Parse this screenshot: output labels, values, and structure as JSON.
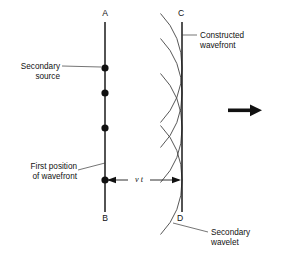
{
  "figure": {
    "background_color": "#ffffff",
    "ink_color": "#111111",
    "arc_color": "#3a3a3a"
  },
  "point_labels": {
    "a": "A",
    "b": "B",
    "c": "C",
    "d": "D"
  },
  "callouts": {
    "secondary_source_line1": "Secondary",
    "secondary_source_line2": "source",
    "first_position_line1": "First position",
    "first_position_line2": "of wavefront",
    "constructed_line1": "Constructed",
    "constructed_line2": "wavefront",
    "secondary_wavelet_line1": "Secondary",
    "secondary_wavelet_line2": "wavelet"
  },
  "dimension": {
    "label": "v t",
    "meaning": "distance travelled in time t at speed v"
  },
  "direction_arrow": {
    "name": "propagation-direction-arrow",
    "points": "right"
  },
  "geometry": {
    "wavefront_ab_x": 105,
    "wavefront_ab_y_top": 22,
    "wavefront_ab_y_bottom": 212,
    "wavefront_cd_x": 182,
    "wavefront_cd_y_top": 22,
    "wavefront_cd_y_bottom": 212,
    "source_dot_y_values": [
      68,
      93,
      128,
      180
    ],
    "arc_radius": 77,
    "dimension_y": 180
  }
}
